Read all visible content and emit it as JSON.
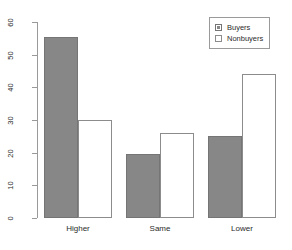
{
  "chart_data": {
    "type": "bar",
    "title": "",
    "subtitle": "",
    "xlabel": "",
    "ylabel": "",
    "categories": [
      "Higher",
      "Same",
      "Lower"
    ],
    "series": [
      {
        "name": "Buyers",
        "values": [
          55.5,
          19.5,
          25.0
        ],
        "color": "#878787",
        "fill": "solid"
      },
      {
        "name": "Nonbuyers",
        "values": [
          30.0,
          26.0,
          44.0
        ],
        "color": "#ffffff",
        "fill": "open"
      }
    ],
    "ylim": [
      0,
      60
    ],
    "yticks": [
      0,
      10,
      20,
      30,
      40,
      50,
      60
    ],
    "ytick_labels": [
      "0",
      "10",
      "20",
      "30",
      "40",
      "50",
      "60"
    ],
    "grid": false,
    "legend_position": "top-right",
    "legend_entries": [
      "Buyers",
      "Nonbuyers"
    ],
    "annotations": []
  },
  "axis": {
    "ticks": [
      {
        "label": "0"
      },
      {
        "label": "10"
      },
      {
        "label": "20"
      },
      {
        "label": "30"
      },
      {
        "label": "40"
      },
      {
        "label": "50"
      },
      {
        "label": "60"
      }
    ]
  },
  "xaxis": {
    "labels": [
      {
        "text": "Higher"
      },
      {
        "text": "Same"
      },
      {
        "text": "Lower"
      }
    ]
  },
  "legend": {
    "entries": [
      {
        "label": "Buyers",
        "swatch": "filled-square-icon"
      },
      {
        "label": "Nonbuyers",
        "swatch": "open-square-icon"
      }
    ]
  }
}
